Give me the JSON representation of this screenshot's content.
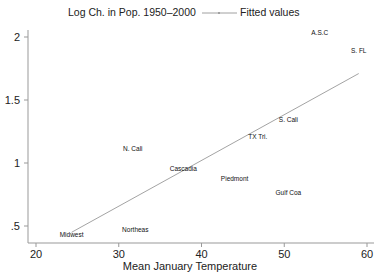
{
  "chart_data": {
    "type": "scatter",
    "title": "",
    "xlabel": "Mean January Temperature",
    "ylabel": "Log Ch. in Pop. 1950–2000",
    "xlim": [
      19,
      61
    ],
    "ylim": [
      0.37,
      2.07
    ],
    "xticks": [
      20,
      30,
      40,
      50,
      60
    ],
    "xtick_labels": [
      "20",
      "30",
      "40",
      "50",
      "60"
    ],
    "yticks": [
      0.5,
      1,
      1.5,
      2
    ],
    "ytick_labels": [
      ".5",
      "1",
      "1.5",
      "2"
    ],
    "grid": false,
    "legend": {
      "position": "top",
      "entries": [
        "Log Ch. in Pop. 1950–2000",
        "Fitted values"
      ]
    },
    "series": [
      {
        "name": "Log Ch. in Pop. 1950–2000",
        "marker": "label",
        "points": [
          {
            "label": "Midwest",
            "x": 24.3,
            "y": 0.43
          },
          {
            "label": "Northeas",
            "x": 32.0,
            "y": 0.47
          },
          {
            "label": "N. Cali",
            "x": 31.7,
            "y": 1.11
          },
          {
            "label": "Cascadia",
            "x": 37.8,
            "y": 0.95
          },
          {
            "label": "Piedmont",
            "x": 44.0,
            "y": 0.87
          },
          {
            "label": "TX Tri.",
            "x": 46.8,
            "y": 1.21
          },
          {
            "label": "S. Cali",
            "x": 50.5,
            "y": 1.34
          },
          {
            "label": "Gulf Coa",
            "x": 50.5,
            "y": 0.76
          },
          {
            "label": "A.S.C",
            "x": 54.3,
            "y": 2.03
          },
          {
            "label": "S. FL",
            "x": 59.0,
            "y": 1.89
          }
        ]
      },
      {
        "name": "Fitted values",
        "type": "line",
        "x": [
          24.3,
          59.0
        ],
        "y": [
          0.45,
          1.71
        ]
      }
    ]
  }
}
